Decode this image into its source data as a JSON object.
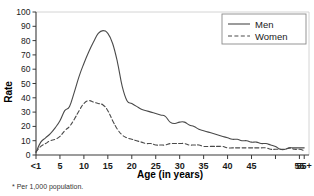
{
  "chart_data": {
    "type": "line",
    "title": "",
    "xlabel": "Age (in years)",
    "ylabel": "Rate",
    "footnote": "* Per 1,000 population.",
    "grid": false,
    "legend_position": "top-right",
    "xlim": [
      0,
      57
    ],
    "ylim": [
      0,
      100
    ],
    "y_ticks": [
      0,
      10,
      20,
      30,
      40,
      50,
      60,
      70,
      80,
      90,
      100
    ],
    "y_tick_labels": [
      "0",
      "10",
      "20",
      "30",
      "40",
      "50",
      "60",
      "70",
      "80",
      "90",
      "100"
    ],
    "x_ticks": [
      0,
      5,
      10,
      15,
      20,
      25,
      30,
      35,
      40,
      45,
      50,
      55
    ],
    "x_tick_labels": [
      "<1",
      "5",
      "10",
      "15",
      "20",
      "25",
      "30",
      "35",
      "40",
      "45",
      "",
      "55"
    ],
    "x_end_label": "55+",
    "x": [
      0,
      1,
      2,
      3,
      4,
      5,
      6,
      7,
      8,
      9,
      10,
      11,
      12,
      13,
      14,
      15,
      16,
      17,
      18,
      19,
      20,
      21,
      22,
      23,
      24,
      25,
      26,
      27,
      28,
      29,
      30,
      31,
      32,
      33,
      34,
      35,
      36,
      37,
      38,
      39,
      40,
      41,
      42,
      43,
      44,
      45,
      46,
      47,
      48,
      49,
      50,
      51,
      52,
      53,
      54,
      55,
      56
    ],
    "series": [
      {
        "name": "Men",
        "style": "solid",
        "color": "#4a4a4a",
        "values": [
          2,
          9,
          12,
          15,
          19,
          24,
          31,
          34,
          44,
          55,
          64,
          72,
          79,
          85,
          87,
          85,
          78,
          65,
          48,
          38,
          36,
          34,
          32,
          31,
          30,
          29,
          28,
          27,
          23,
          22,
          23,
          23,
          21,
          20,
          18,
          17,
          16,
          15,
          14,
          13,
          12,
          11,
          11,
          10,
          10,
          9,
          9,
          8,
          8,
          7,
          6,
          4,
          4,
          5,
          5,
          5,
          5
        ]
      },
      {
        "name": "Women",
        "style": "dashed",
        "color": "#4a4a4a",
        "values": [
          2,
          6,
          8,
          10,
          11,
          13,
          17,
          20,
          25,
          31,
          36,
          38,
          37,
          36,
          35,
          31,
          24,
          18,
          14,
          12,
          11,
          10,
          9,
          8,
          8,
          7,
          7,
          7,
          8,
          8,
          8,
          8,
          7,
          7,
          7,
          6,
          6,
          6,
          6,
          6,
          5,
          5,
          5,
          5,
          5,
          5,
          5,
          5,
          5,
          4,
          4,
          4,
          4,
          5,
          4,
          4,
          3
        ]
      }
    ],
    "legend": [
      {
        "label": "Men",
        "style": "solid"
      },
      {
        "label": "Women",
        "style": "dashed"
      }
    ]
  }
}
